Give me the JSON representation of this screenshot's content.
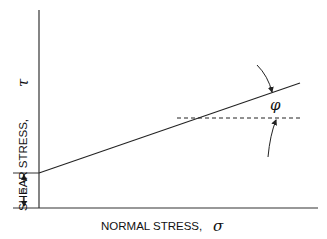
{
  "diagram": {
    "type": "mohr-coulomb-failure-envelope",
    "x_axis_label": "NORMAL STRESS,",
    "x_axis_symbol": "σ",
    "y_axis_label": "SHEAR STRESS,",
    "y_axis_symbol": "τ",
    "intercept_label": "c",
    "angle_label": "φ",
    "line_color": "#222222"
  }
}
